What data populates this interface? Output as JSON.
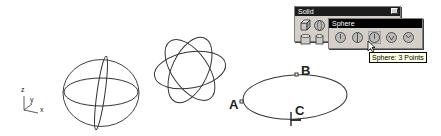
{
  "viewport": {
    "axis_labels": {
      "z": "z",
      "y": "y",
      "x": "x"
    },
    "point_labels": {
      "a": "A",
      "b": "B",
      "c": "C"
    }
  },
  "solid_toolbar": {
    "title": "Solid",
    "buttons": [
      "box-icon",
      "sphere-icon",
      "cylinder-icon",
      "cylinder-2-icon"
    ]
  },
  "sphere_flyout": {
    "title": "Sphere",
    "buttons": [
      "sphere-center-radius-icon",
      "sphere-diameter-icon",
      "sphere-3-points-icon",
      "sphere-4-points-icon",
      "sphere-fit-icon"
    ],
    "active_index": 2
  },
  "tooltip": {
    "text": "Sphere: 3 Points"
  }
}
